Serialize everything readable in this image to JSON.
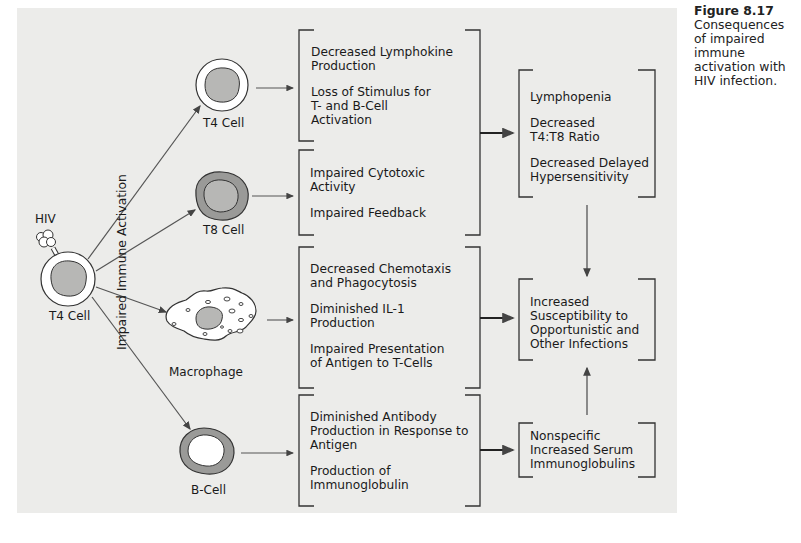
{
  "caption": {
    "figure_number": "Figure 8.17",
    "text": "Consequences of impaired immune activation with HIV infection."
  },
  "source": {
    "virus_label": "HIV",
    "cell_label": "T4 Cell",
    "process_label": "Impaired Immune Activation"
  },
  "target_cells": [
    {
      "id": "t4",
      "label": "T4 Cell"
    },
    {
      "id": "t8",
      "label": "T8 Cell"
    },
    {
      "id": "macrophage",
      "label": "Macrophage"
    },
    {
      "id": "bcell",
      "label": "B-Cell"
    }
  ],
  "effect_boxes": [
    {
      "id": "t4-effects",
      "items": [
        "Decreased Lymphokine\nProduction",
        "Loss of Stimulus for\nT- and B-Cell\nActivation"
      ]
    },
    {
      "id": "t8-effects",
      "items": [
        "Impaired Cytotoxic\nActivity",
        "Impaired Feedback"
      ]
    },
    {
      "id": "macrophage-effects",
      "items": [
        "Decreased Chemotaxis\nand Phagocytosis",
        "Diminished IL-1\nProduction",
        "Impaired Presentation\nof Antigen to T-Cells"
      ]
    },
    {
      "id": "bcell-effects",
      "items": [
        "Diminished Antibody\nProduction in Response to\nAntigen",
        "Production of\nImmunoglobulin"
      ]
    }
  ],
  "outcome_boxes": [
    {
      "id": "lymphopenia",
      "items": [
        "Lymphopenia",
        "Decreased\nT4:T8 Ratio",
        "Decreased Delayed\nHypersensitivity"
      ]
    },
    {
      "id": "susceptibility",
      "items": [
        "Increased\nSusceptibility to\nOpportunistic and\nOther Infections"
      ]
    },
    {
      "id": "immunoglobulins",
      "items": [
        "Nonspecific\nIncreased Serum\nImmunoglobulins"
      ]
    }
  ],
  "colors": {
    "panel": "#ececea",
    "line": "#555555",
    "nucleus": "#b7b7b5",
    "t8_ring": "#9a9a98",
    "cell_fill": "#ffffff"
  }
}
